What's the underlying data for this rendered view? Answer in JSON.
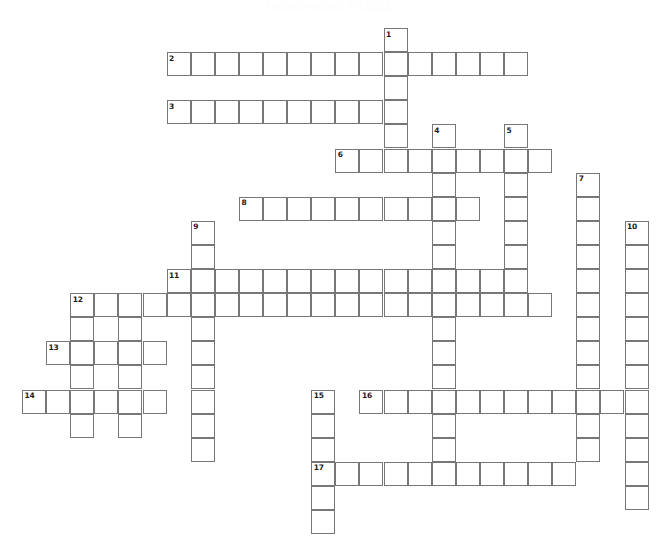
{
  "puzzle": {
    "title": "CROSSWORD PUZZLE",
    "type": "crossword-grid",
    "cell_size_px": 24.1,
    "origin_x_px": 22,
    "origin_y_px": 28,
    "grid_columns": 27,
    "grid_rows": 21,
    "cell_border_color": "#777777",
    "cell_fill_color": "#ffffff",
    "background_color": "#ffffff",
    "number_color": "#1a1a1a",
    "entries": [
      {
        "number": "1",
        "direction": "down",
        "col": 15,
        "row": 0,
        "length": 6
      },
      {
        "number": "2",
        "direction": "across",
        "col": 6,
        "row": 1,
        "length": 15
      },
      {
        "number": "3",
        "direction": "across",
        "col": 6,
        "row": 3,
        "length": 10
      },
      {
        "number": "4",
        "direction": "down",
        "col": 17,
        "row": 4,
        "length": 14
      },
      {
        "number": "5",
        "direction": "down",
        "col": 20,
        "row": 4,
        "length": 8
      },
      {
        "number": "6",
        "direction": "across",
        "col": 13,
        "row": 5,
        "length": 9
      },
      {
        "number": "7",
        "direction": "down",
        "col": 23,
        "row": 6,
        "length": 12
      },
      {
        "number": "8",
        "direction": "across",
        "col": 9,
        "row": 7,
        "length": 10
      },
      {
        "number": "9",
        "direction": "down",
        "col": 7,
        "row": 8,
        "length": 10
      },
      {
        "number": "10",
        "direction": "down",
        "col": 25,
        "row": 8,
        "length": 12
      },
      {
        "number": "11",
        "direction": "across",
        "col": 6,
        "row": 10,
        "length": 14
      },
      {
        "number": "12",
        "direction": "across",
        "col": 2,
        "row": 11,
        "length": 20
      },
      {
        "number": "13",
        "direction": "across",
        "col": 1,
        "row": 13,
        "length": 5
      },
      {
        "number": "14",
        "direction": "across",
        "col": 0,
        "row": 15,
        "length": 6
      },
      {
        "number": "15",
        "direction": "down",
        "col": 12,
        "row": 15,
        "length": 6
      },
      {
        "number": "16",
        "direction": "across",
        "col": 14,
        "row": 15,
        "length": 12
      },
      {
        "number": "17",
        "direction": "across",
        "col": 12,
        "row": 18,
        "length": 11
      }
    ],
    "extra_cells": [
      {
        "col": 2,
        "row": 12
      },
      {
        "col": 2,
        "row": 14
      },
      {
        "col": 2,
        "row": 16
      },
      {
        "col": 4,
        "row": 12
      },
      {
        "col": 4,
        "row": 13
      },
      {
        "col": 4,
        "row": 14
      },
      {
        "col": 4,
        "row": 15
      },
      {
        "col": 4,
        "row": 16
      },
      {
        "col": 12,
        "row": 19
      },
      {
        "col": 12,
        "row": 20
      }
    ]
  }
}
